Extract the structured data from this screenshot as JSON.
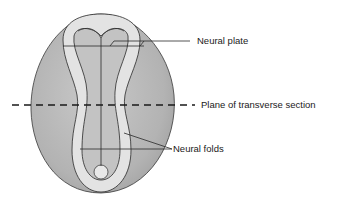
{
  "diagram": {
    "type": "embryo-neural-plate-dorsal-view",
    "labels": {
      "neural_plate": "Neural plate",
      "plane": "Plane of transverse section",
      "neural_folds": "Neural folds"
    },
    "colors": {
      "embryo_fill": "#b9b9b9",
      "fold_fill": "#e2e2e2",
      "plate_fill": "#c4c4c4",
      "outline": "#2a2a2a"
    }
  }
}
